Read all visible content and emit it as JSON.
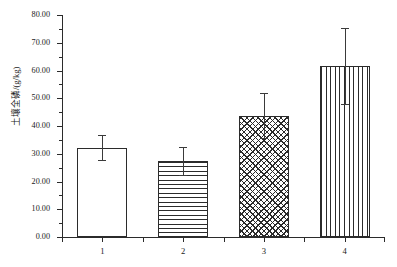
{
  "chart_data": {
    "type": "bar",
    "title": "",
    "xlabel": "",
    "ylabel": "土壤全磷/(g/kg)",
    "categories": [
      "1",
      "2",
      "3",
      "4"
    ],
    "values": [
      32.2,
      27.4,
      43.7,
      61.5
    ],
    "errors": [
      4.6,
      5.0,
      8.2,
      13.7
    ],
    "error_upper": [
      36.8,
      32.4,
      51.9,
      75.2
    ],
    "error_lower": [
      27.6,
      22.4,
      35.5,
      47.8
    ],
    "ylim": [
      0,
      80
    ],
    "ytick_labels": [
      "0.00",
      "10.00",
      "20.00",
      "30.00",
      "40.00",
      "50.00",
      "60.00",
      "70.00",
      "80.00"
    ],
    "ytick_values": [
      0,
      10,
      20,
      30,
      40,
      50,
      60,
      70,
      80
    ],
    "yminor_values": [
      5,
      15,
      25,
      35,
      45,
      55,
      65,
      75
    ],
    "grid": false,
    "legend": "none",
    "bar_fills": [
      "none",
      "horizontal-lines",
      "crosshatch",
      "vertical-lines"
    ],
    "axis_color": "#2b2b2b",
    "bar_edge_color": "#2b2b2b",
    "bar_face_color": "#ffffff",
    "error_color": "#3a3a3a",
    "background": "#ffffff"
  }
}
